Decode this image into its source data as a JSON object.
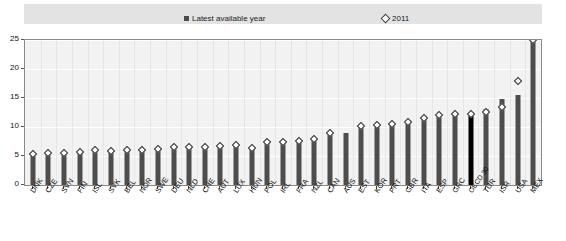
{
  "legend": {
    "entries": [
      {
        "label": "Latest available year",
        "marker": "square",
        "color": "#4a4a4a"
      },
      {
        "label": "2011",
        "marker": "diamond",
        "color": "#ffffff"
      }
    ]
  },
  "yaxis": {
    "ticks": [
      "0",
      "5",
      "10",
      "15",
      "20",
      "25"
    ],
    "min": 0,
    "max": 25
  },
  "chart_data": {
    "type": "bar",
    "title": "",
    "xlabel": "",
    "ylabel": "",
    "ylim": [
      0,
      25
    ],
    "grid": true,
    "legend_position": "top",
    "categories": [
      "DNK",
      "CZE",
      "SVN",
      "FIN",
      "ISL",
      "SVK",
      "BEL",
      "NOR",
      "SWE",
      "DEU",
      "NLD",
      "CHE",
      "AUT",
      "LUX",
      "HUN",
      "POL",
      "IRL",
      "FRA",
      "NZL",
      "CAN",
      "AUS",
      "EST",
      "KOR",
      "PRT",
      "GBR",
      "ITA",
      "ESP",
      "GRC",
      "OECD 30",
      "TUR",
      "ISR",
      "USA",
      "MEX"
    ],
    "series": [
      {
        "name": "Latest available year",
        "marker": "bar",
        "values": [
          5.4,
          5.5,
          5.6,
          5.7,
          5.8,
          5.9,
          6.0,
          6.0,
          6.1,
          6.4,
          6.5,
          6.5,
          6.6,
          6.7,
          6.8,
          7.3,
          7.4,
          7.5,
          7.9,
          8.7,
          9.0,
          9.9,
          10.0,
          10.2,
          10.5,
          11.3,
          11.8,
          12.0,
          12.2,
          13.1,
          14.9,
          15.5,
          25.0
        ]
      },
      {
        "name": "2011",
        "marker": "diamond",
        "values": [
          5.4,
          5.6,
          5.6,
          5.7,
          6.0,
          5.9,
          6.1,
          6.0,
          6.2,
          6.5,
          6.6,
          6.6,
          6.8,
          6.9,
          6.3,
          7.4,
          7.5,
          7.6,
          8.0,
          9.0,
          null,
          10.2,
          10.4,
          10.5,
          10.8,
          11.6,
          12.1,
          12.3,
          12.2,
          12.6,
          13.4,
          18.0,
          25.0
        ]
      }
    ],
    "highlight_category": "OECD 30",
    "highlight_color": "#000000",
    "bar_color": "#4d4d4d"
  }
}
